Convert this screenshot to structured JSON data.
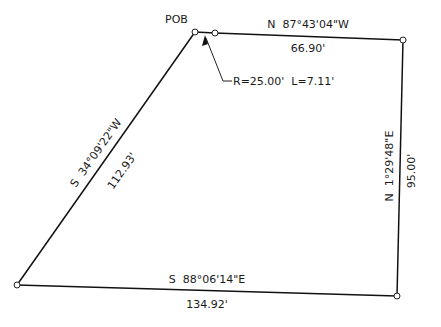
{
  "diagram": {
    "type": "survey-plat",
    "colors": {
      "line": "#111111",
      "text": "#1a1a1a",
      "background": "#ffffff"
    },
    "point_of_beginning": {
      "label": "POB"
    },
    "curve": {
      "label": "R=25.00'  L=7.11'",
      "radius": "25.00'",
      "length": "7.11'"
    },
    "courses": [
      {
        "id": "north",
        "bearing": "N  87°43'04\"W",
        "distance": "66.90'"
      },
      {
        "id": "east",
        "bearing": "N  1°29'48\"E",
        "distance": "95.00'"
      },
      {
        "id": "south",
        "bearing": "S  88°06'14\"E",
        "distance": "134.92'"
      },
      {
        "id": "west",
        "bearing": "S  34°09'22\"W",
        "distance": "112.93'"
      }
    ]
  }
}
